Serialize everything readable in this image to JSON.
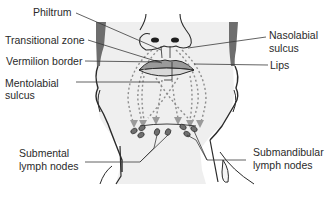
{
  "diagram": {
    "type": "anatomical-illustration",
    "labels_left": [
      {
        "id": "philtrum",
        "text": "Philtrum"
      },
      {
        "id": "transitional-zone",
        "text": "Transitional zone"
      },
      {
        "id": "vermilion-border",
        "text": "Vermilion border"
      },
      {
        "id": "mentolabial-sulcus",
        "line1": "Mentolabial",
        "line2": "sulcus"
      },
      {
        "id": "submental-lymph-nodes",
        "line1": "Submental",
        "line2": "lymph nodes"
      }
    ],
    "labels_right": [
      {
        "id": "nasolabial-sulcus",
        "line1": "Nasolabial",
        "line2": "sulcus"
      },
      {
        "id": "lips",
        "text": "Lips"
      },
      {
        "id": "submandibular-lymph-nodes",
        "line1": "Submandibular",
        "line2": "lymph nodes"
      }
    ],
    "colors": {
      "background": "#ffffff",
      "skin": "#efefef",
      "outline": "#2a2a2a",
      "lip_fill": "#8a8a8a",
      "node_fill": "#6f6f6f",
      "arrow": "#9a9a9a",
      "leader": "#3a3a3a"
    }
  }
}
